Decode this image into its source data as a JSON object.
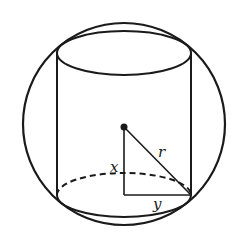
{
  "diagram": {
    "stroke_color": "#1a1a1a",
    "background": "#ffffff",
    "labels": {
      "x": "x",
      "y": "y",
      "r": "r"
    },
    "sphere": {
      "cx": 124,
      "cy": 124,
      "r": 101
    },
    "cylinder": {
      "left_x": 57,
      "right_x": 191,
      "top_ellipse": {
        "cx": 124,
        "cy": 53,
        "rx": 67,
        "ry": 22
      },
      "bottom_ellipse": {
        "cx": 124,
        "cy": 195,
        "rx": 67,
        "ry": 22
      }
    },
    "center_point": {
      "x": 124,
      "y": 127
    },
    "triangle": {
      "vertex_center": [
        124,
        127
      ],
      "vertex_right_angle": [
        124,
        195
      ],
      "vertex_rim": [
        191,
        195
      ]
    }
  }
}
